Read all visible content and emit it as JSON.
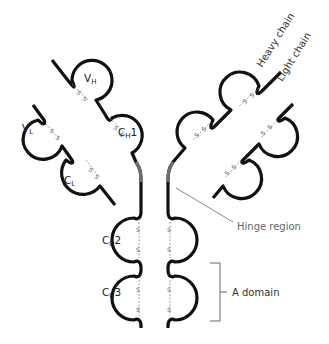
{
  "diagram": {
    "domains": {
      "vh": {
        "main": "V",
        "sub": "H"
      },
      "vl": {
        "main": "V",
        "sub": "L"
      },
      "ch1": {
        "main": "C",
        "sub": "H",
        "suffix": "1"
      },
      "cl": {
        "main": "C",
        "sub": "L"
      },
      "ch2": {
        "main": "C",
        "sub": "H",
        "suffix": "2"
      },
      "ch3": {
        "main": "C",
        "sub": "H",
        "suffix": "3"
      }
    },
    "disulfide_label": "S—S",
    "annotations": {
      "heavy_chain": "Heavy chain",
      "light_chain": "Light chain",
      "hinge_region": "Hinge region",
      "a_domain": "A domain"
    },
    "colors": {
      "chain": "#111111",
      "hinge": "#6e6e6e",
      "disulfide": "#8a8a8a",
      "annotation_line": "#888888"
    }
  }
}
